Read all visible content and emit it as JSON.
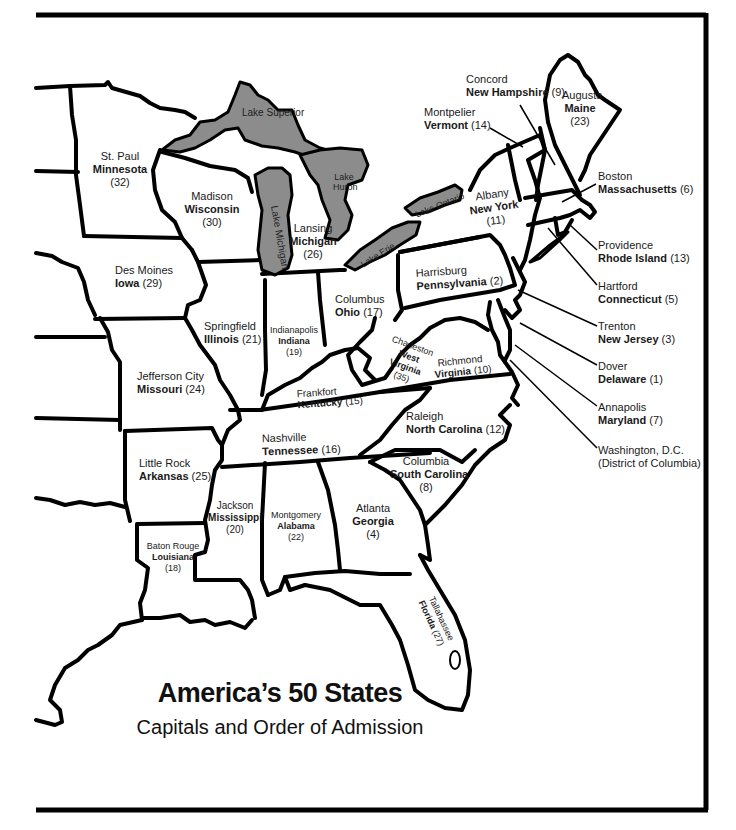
{
  "title": "America’s 50 States",
  "subtitle": "Capitals and Order of Admission",
  "colors": {
    "lake": "#8c8c8c",
    "border": "#000000",
    "land": "#ffffff"
  },
  "lakes": {
    "superior": "Lake Superior",
    "michigan": "Lake Michigan",
    "huron": "Lake Huron",
    "erie": "Lake Erie",
    "ontario": "Lake Ontario"
  },
  "states": {
    "minnesota": {
      "capital": "St. Paul",
      "name": "Minnesota",
      "order": "(32)"
    },
    "wisconsin": {
      "capital": "Madison",
      "name": "Wisconsin",
      "order": "(30)"
    },
    "michigan": {
      "capital": "Lansing",
      "name": "Michigan",
      "order": "(26)"
    },
    "iowa": {
      "capital": "Des Moines",
      "name": "Iowa",
      "order": "(29)"
    },
    "illinois": {
      "capital": "Springfield",
      "name": "Illinois",
      "order": "(21)"
    },
    "indiana": {
      "capital": "Indianapolis",
      "name": "Indiana",
      "order": "(19)"
    },
    "ohio": {
      "capital": "Columbus",
      "name": "Ohio",
      "order": "(17)"
    },
    "missouri": {
      "capital": "Jefferson City",
      "name": "Missouri",
      "order": "(24)"
    },
    "kentucky": {
      "capital": "Frankfort",
      "name": "Kentucky",
      "order": "(15)"
    },
    "westvirginia": {
      "capital": "Charleston",
      "name1": "West",
      "name2": "Virginia",
      "order": "(35)"
    },
    "virginia": {
      "capital": "Richmond",
      "name": "Virginia",
      "order": "(10)"
    },
    "tennessee": {
      "capital": "Nashville",
      "name": "Tennessee",
      "order": "(16)"
    },
    "northcarolina": {
      "capital": "Raleigh",
      "name": "North Carolina",
      "order": "(12)"
    },
    "arkansas": {
      "capital": "Little Rock",
      "name": "Arkansas",
      "order": "(25)"
    },
    "southcarolina": {
      "capital": "Columbia",
      "name": "South Carolina",
      "order": "(8)"
    },
    "mississippi": {
      "capital": "Jackson",
      "name": "Mississippi",
      "order": "(20)"
    },
    "alabama": {
      "capital": "Montgomery",
      "name": "Alabama",
      "order": "(22)"
    },
    "georgia": {
      "capital": "Atlanta",
      "name": "Georgia",
      "order": "(4)"
    },
    "louisiana": {
      "capital": "Baton Rouge",
      "name": "Louisiana",
      "order": "(18)"
    },
    "florida": {
      "capital": "Tallahassee",
      "name": "Florida",
      "order": "(27)"
    },
    "pennsylvania": {
      "capital": "Harrisburg",
      "name": "Pennsylvania",
      "order": "(2)"
    },
    "newyork": {
      "capital": "Albany",
      "name": "New York",
      "order": "(11)"
    },
    "vermont": {
      "capital": "Montpelier",
      "name": "Vermont",
      "order": "(14)"
    },
    "newhampshire": {
      "capital": "Concord",
      "name": "New Hampshire",
      "order": "(9)"
    },
    "maine": {
      "capital": "Augusta",
      "name": "Maine",
      "order": "(23)"
    },
    "massachusetts": {
      "capital": "Boston",
      "name": "Massachusetts",
      "order": "(6)"
    },
    "rhodeisland": {
      "capital": "Providence",
      "name": "Rhode Island",
      "order": "(13)"
    },
    "connecticut": {
      "capital": "Hartford",
      "name": "Connecticut",
      "order": "(5)"
    },
    "newjersey": {
      "capital": "Trenton",
      "name": "New Jersey",
      "order": "(3)"
    },
    "delaware": {
      "capital": "Dover",
      "name": "Delaware",
      "order": "(1)"
    },
    "maryland": {
      "capital": "Annapolis",
      "name": "Maryland",
      "order": "(7)"
    },
    "dc": {
      "name1": "Washington, D.C.",
      "name2": "(District of Columbia)"
    }
  }
}
